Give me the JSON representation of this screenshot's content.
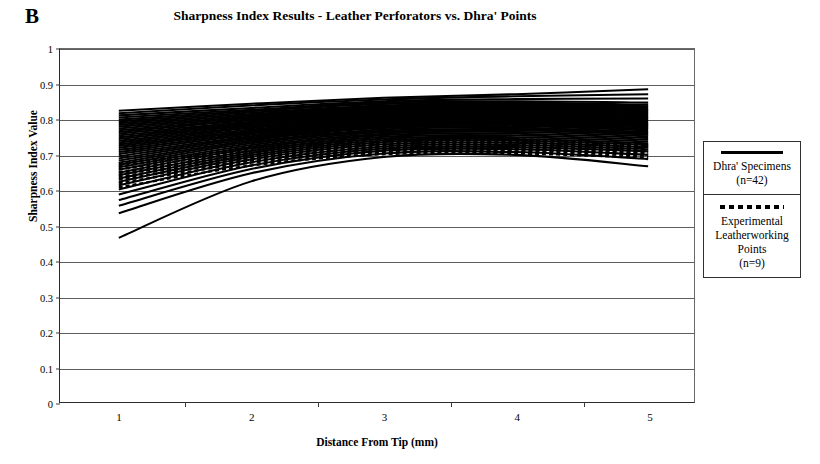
{
  "panel": {
    "label": "B"
  },
  "chart_data": {
    "type": "line",
    "title": "Sharpness Index Results - Leather Perforators vs. Dhra' Points",
    "xlabel": "Distance From Tip (mm)",
    "ylabel": "Sharpness Index Value",
    "x": [
      1,
      2,
      3,
      4,
      5
    ],
    "xticklabels": [
      "1",
      "2",
      "3",
      "4",
      "5"
    ],
    "yticklabels": [
      "0",
      "0.1",
      "0.2",
      "0.3",
      "0.4",
      "0.5",
      "0.6",
      "0.7",
      "0.8",
      "0.9",
      "1"
    ],
    "ylim": [
      0,
      1
    ],
    "ytick_step": 0.1,
    "grid": "horizontal",
    "legend_position": "right-outside",
    "legend": [
      {
        "style": "solid",
        "name": "Dhra' Specimens",
        "count_label": "(n=42)",
        "n": 42
      },
      {
        "style": "dashed",
        "name": "Experimental Leatherworking Points",
        "name_lines": [
          "Experimental",
          "Leatherworking",
          "Points"
        ],
        "count_label": "(n=9)",
        "n": 9
      }
    ],
    "series": [
      {
        "name": "Dhra' 01",
        "style": "solid",
        "values": [
          0.825,
          0.845,
          0.862,
          0.872,
          0.886
        ]
      },
      {
        "name": "Dhra' 02",
        "style": "solid",
        "values": [
          0.818,
          0.84,
          0.857,
          0.866,
          0.872
        ]
      },
      {
        "name": "Dhra' 03",
        "style": "solid",
        "values": [
          0.812,
          0.833,
          0.852,
          0.858,
          0.86
        ]
      },
      {
        "name": "Dhra' 04",
        "style": "solid",
        "values": [
          0.806,
          0.828,
          0.848,
          0.852,
          0.848
        ]
      },
      {
        "name": "Dhra' 05",
        "style": "solid",
        "values": [
          0.8,
          0.824,
          0.844,
          0.848,
          0.842
        ]
      },
      {
        "name": "Dhra' 06",
        "style": "solid",
        "values": [
          0.795,
          0.82,
          0.84,
          0.845,
          0.838
        ]
      },
      {
        "name": "Dhra' 07",
        "style": "solid",
        "values": [
          0.79,
          0.816,
          0.837,
          0.842,
          0.834
        ]
      },
      {
        "name": "Dhra' 08",
        "style": "solid",
        "values": [
          0.785,
          0.812,
          0.834,
          0.839,
          0.83
        ]
      },
      {
        "name": "Dhra' 09",
        "style": "solid",
        "values": [
          0.78,
          0.808,
          0.831,
          0.836,
          0.827
        ]
      },
      {
        "name": "Dhra' 10",
        "style": "solid",
        "values": [
          0.775,
          0.805,
          0.828,
          0.833,
          0.824
        ]
      },
      {
        "name": "Dhra' 11",
        "style": "solid",
        "values": [
          0.77,
          0.801,
          0.825,
          0.83,
          0.821
        ]
      },
      {
        "name": "Dhra' 12",
        "style": "solid",
        "values": [
          0.765,
          0.798,
          0.822,
          0.827,
          0.818
        ]
      },
      {
        "name": "Dhra' 13",
        "style": "solid",
        "values": [
          0.76,
          0.794,
          0.819,
          0.824,
          0.815
        ]
      },
      {
        "name": "Dhra' 14",
        "style": "solid",
        "values": [
          0.755,
          0.79,
          0.816,
          0.821,
          0.812
        ]
      },
      {
        "name": "Dhra' 15",
        "style": "solid",
        "values": [
          0.75,
          0.787,
          0.813,
          0.818,
          0.809
        ]
      },
      {
        "name": "Dhra' 16",
        "style": "solid",
        "values": [
          0.745,
          0.783,
          0.81,
          0.815,
          0.806
        ]
      },
      {
        "name": "Dhra' 17",
        "style": "solid",
        "values": [
          0.74,
          0.779,
          0.807,
          0.812,
          0.803
        ]
      },
      {
        "name": "Dhra' 18",
        "style": "solid",
        "values": [
          0.735,
          0.776,
          0.804,
          0.809,
          0.8
        ]
      },
      {
        "name": "Dhra' 19",
        "style": "solid",
        "values": [
          0.73,
          0.772,
          0.801,
          0.806,
          0.796
        ]
      },
      {
        "name": "Dhra' 20",
        "style": "solid",
        "values": [
          0.725,
          0.768,
          0.798,
          0.803,
          0.792
        ]
      },
      {
        "name": "Dhra' 21",
        "style": "solid",
        "values": [
          0.72,
          0.765,
          0.795,
          0.8,
          0.789
        ]
      },
      {
        "name": "Dhra' 22",
        "style": "solid",
        "values": [
          0.714,
          0.761,
          0.792,
          0.797,
          0.786
        ]
      },
      {
        "name": "Dhra' 23",
        "style": "solid",
        "values": [
          0.708,
          0.757,
          0.789,
          0.794,
          0.783
        ]
      },
      {
        "name": "Dhra' 24",
        "style": "solid",
        "values": [
          0.702,
          0.753,
          0.786,
          0.791,
          0.78
        ]
      },
      {
        "name": "Dhra' 25",
        "style": "solid",
        "values": [
          0.696,
          0.749,
          0.783,
          0.788,
          0.777
        ]
      },
      {
        "name": "Dhra' 26",
        "style": "solid",
        "values": [
          0.69,
          0.745,
          0.78,
          0.785,
          0.773
        ]
      },
      {
        "name": "Dhra' 27",
        "style": "solid",
        "values": [
          0.684,
          0.741,
          0.776,
          0.781,
          0.769
        ]
      },
      {
        "name": "Dhra' 28",
        "style": "solid",
        "values": [
          0.678,
          0.737,
          0.772,
          0.777,
          0.765
        ]
      },
      {
        "name": "Dhra' 29",
        "style": "solid",
        "values": [
          0.672,
          0.733,
          0.768,
          0.773,
          0.761
        ]
      },
      {
        "name": "Dhra' 30",
        "style": "solid",
        "values": [
          0.665,
          0.728,
          0.764,
          0.769,
          0.757
        ]
      },
      {
        "name": "Dhra' 31",
        "style": "solid",
        "values": [
          0.658,
          0.723,
          0.76,
          0.765,
          0.753
        ]
      },
      {
        "name": "Dhra' 32",
        "style": "solid",
        "values": [
          0.65,
          0.718,
          0.756,
          0.76,
          0.748
        ]
      },
      {
        "name": "Dhra' 33",
        "style": "solid",
        "values": [
          0.642,
          0.712,
          0.751,
          0.755,
          0.743
        ]
      },
      {
        "name": "Dhra' 34",
        "style": "solid",
        "values": [
          0.633,
          0.706,
          0.746,
          0.75,
          0.738
        ]
      },
      {
        "name": "Dhra' 35",
        "style": "solid",
        "values": [
          0.624,
          0.7,
          0.741,
          0.745,
          0.733
        ]
      },
      {
        "name": "Dhra' 36",
        "style": "solid",
        "values": [
          0.614,
          0.694,
          0.736,
          0.74,
          0.728
        ]
      },
      {
        "name": "Dhra' 37",
        "style": "solid",
        "values": [
          0.602,
          0.687,
          0.73,
          0.734,
          0.722
        ]
      },
      {
        "name": "Dhra' 38",
        "style": "solid",
        "values": [
          0.588,
          0.679,
          0.724,
          0.728,
          0.716
        ]
      },
      {
        "name": "Dhra' 39",
        "style": "solid",
        "values": [
          0.572,
          0.67,
          0.718,
          0.722,
          0.71
        ]
      },
      {
        "name": "Dhra' 40",
        "style": "solid",
        "values": [
          0.556,
          0.66,
          0.712,
          0.716,
          0.7
        ]
      },
      {
        "name": "Dhra' 41",
        "style": "solid",
        "values": [
          0.535,
          0.648,
          0.704,
          0.708,
          0.688
        ]
      },
      {
        "name": "Dhra' 42",
        "style": "solid",
        "values": [
          0.465,
          0.625,
          0.694,
          0.7,
          0.668
        ]
      },
      {
        "name": "Experimental 1",
        "style": "dashed",
        "values": [
          0.676,
          0.718,
          0.742,
          0.744,
          0.73
        ]
      },
      {
        "name": "Experimental 2",
        "style": "dashed",
        "values": [
          0.668,
          0.712,
          0.737,
          0.739,
          0.726
        ]
      },
      {
        "name": "Experimental 3",
        "style": "dashed",
        "values": [
          0.66,
          0.706,
          0.732,
          0.734,
          0.722
        ]
      },
      {
        "name": "Experimental 4",
        "style": "dashed",
        "values": [
          0.652,
          0.7,
          0.727,
          0.729,
          0.717
        ]
      },
      {
        "name": "Experimental 5",
        "style": "dashed",
        "values": [
          0.645,
          0.695,
          0.722,
          0.724,
          0.712
        ]
      },
      {
        "name": "Experimental 6",
        "style": "dashed",
        "values": [
          0.638,
          0.69,
          0.718,
          0.72,
          0.708
        ]
      },
      {
        "name": "Experimental 7",
        "style": "dashed",
        "values": [
          0.63,
          0.684,
          0.713,
          0.715,
          0.703
        ]
      },
      {
        "name": "Experimental 8",
        "style": "dashed",
        "values": [
          0.62,
          0.678,
          0.708,
          0.71,
          0.698
        ]
      },
      {
        "name": "Experimental 9",
        "style": "dashed",
        "values": [
          0.608,
          0.67,
          0.702,
          0.704,
          0.692
        ]
      }
    ]
  }
}
